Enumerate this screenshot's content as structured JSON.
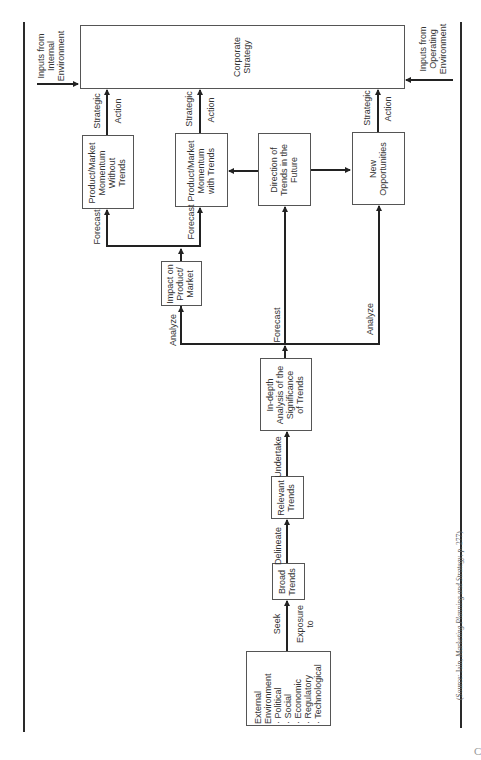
{
  "diagram": {
    "orientation": "rotated -90deg",
    "nodes": {
      "corporate_strategy": "Corporate\nStrategy",
      "pm_without_trends": "Product/Market\nMomentum\nWithout\nTrends",
      "pm_with_trends": "Product/Market\nMomentum\nwith Trends",
      "direction_of_trends": "Direction of\nTrends in the\nFuture",
      "new_opportunities": "New\nOpportunities",
      "impact_on_pm": "Impact on\nProduct/\nMarket",
      "indepth_analysis": "In-depth\nAnalysis of the\nSignificance\nof Trends",
      "relevant_trends": "Relevant\nTrends",
      "broad_trends": "Broad\nTrends",
      "external_environment": "External\nEnvironment\n· Political\n· Social\n· Economic\n· Regulatory\n· Technological"
    },
    "inputs": {
      "internal": "Inputs from\nInternal\nEnvironment",
      "operating": "Inputs from\nOperating\nEnvironment"
    },
    "edge_labels": {
      "strategic": "Strategic",
      "action": "Action",
      "forecast": "Forecast",
      "analyze": "Analyze",
      "undertake": "Undertake",
      "delineate": "Delineate",
      "seek": "Seek",
      "exposure_to": "Exposure\nto"
    },
    "edges": [
      {
        "from": "external_environment",
        "to": "broad_trends",
        "label": "Seek Exposure to"
      },
      {
        "from": "broad_trends",
        "to": "relevant_trends",
        "label": "Delineate"
      },
      {
        "from": "relevant_trends",
        "to": "indepth_analysis",
        "label": "Undertake"
      },
      {
        "from": "indepth_analysis",
        "to": "impact_on_pm",
        "label": "Analyze"
      },
      {
        "from": "indepth_analysis",
        "to": "direction_of_trends",
        "label": "Forecast"
      },
      {
        "from": "indepth_analysis",
        "to": "new_opportunities",
        "label": "Analyze"
      },
      {
        "from": "impact_on_pm",
        "to": "pm_without_trends",
        "label": "Forecast"
      },
      {
        "from": "impact_on_pm",
        "to": "pm_with_trends",
        "label": "Forecast"
      },
      {
        "from": "direction_of_trends",
        "to": "pm_with_trends",
        "label": ""
      },
      {
        "from": "direction_of_trends",
        "to": "new_opportunities",
        "label": ""
      },
      {
        "from": "pm_without_trends",
        "to": "corporate_strategy",
        "label": "Strategic Action"
      },
      {
        "from": "pm_with_trends",
        "to": "corporate_strategy",
        "label": "Strategic Action"
      },
      {
        "from": "new_opportunities",
        "to": "corporate_strategy",
        "label": "Strategic Action"
      },
      {
        "from": "inputs_internal",
        "to": "corporate_strategy",
        "label": "Inputs from Internal Environment"
      },
      {
        "from": "inputs_operating",
        "to": "corporate_strategy",
        "label": "Inputs from Operating Environment"
      }
    ]
  },
  "source": {
    "prefix": "(Source: Jain, ",
    "title": "Marketing Planning and Strategy",
    "suffix": ", p. 277)"
  },
  "page_char": "C"
}
